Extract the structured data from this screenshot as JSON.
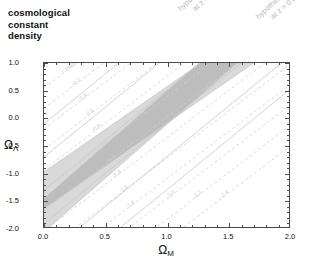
{
  "title": {
    "line1": "cosmological",
    "line2": "constant",
    "line3": "density"
  },
  "axes": {
    "xlabel": "Ω",
    "xlabel_sub": "M",
    "ylabel": "Ω",
    "ylabel_sub": "Λ",
    "xlim": [
      0.0,
      2.0
    ],
    "ylim": [
      -2.0,
      1.0
    ],
    "xticks": [
      "0.0",
      "0.5",
      "1.0",
      "1.5",
      "2.0"
    ],
    "xtick_values": [
      0.0,
      0.5,
      1.0,
      1.5,
      2.0
    ],
    "yticks": [
      "1.0",
      "0.5",
      "0.0",
      "-0.5",
      "-1.0",
      "-1.5",
      "-2.0"
    ],
    "ytick_values": [
      1.0,
      0.5,
      0.0,
      -0.5,
      -1.0,
      -1.5,
      -2.0
    ],
    "minor_per_interval": 5,
    "grid": false
  },
  "annotations": {
    "sn_z10": {
      "line1": "hypothetical SN",
      "line2": "at  z = 1.0"
    },
    "sn_z05": {
      "line1": "hypothetical SN",
      "line2": "at  z = 0.5"
    },
    "mag_label": "mag ="
  },
  "colors": {
    "band_light": "#d9d9d9",
    "band_overlap": "#bdbdbd",
    "contour_dashed": "#cfcfcf",
    "contour_solid": "#c8c8c8",
    "frame": "#4a4a4a",
    "text": "#111111",
    "faint_text": "#b9b9b9"
  },
  "chart_data": {
    "type": "line",
    "title": "cosmological constant density",
    "xlabel": "Ω_M",
    "ylabel": "Ω_Λ",
    "xlim": [
      0.0,
      2.0
    ],
    "ylim": [
      -2.0,
      1.0
    ],
    "grid": false,
    "legend": "none",
    "bands": [
      {
        "name": "hypothetical SN at z = 1.0",
        "slope": 1.55,
        "center_intercept": -1.3,
        "half_width": 0.33,
        "fill": "#d9d9d9",
        "points_lower": [
          [
            0.0,
            -1.95
          ],
          [
            0.5,
            -1.18
          ],
          [
            1.0,
            -0.4
          ],
          [
            1.5,
            0.38
          ],
          [
            2.0,
            1.15
          ]
        ],
        "points_upper": [
          [
            0.0,
            -1.29
          ],
          [
            0.5,
            -0.52
          ],
          [
            1.0,
            0.26
          ],
          [
            1.5,
            1.03
          ],
          [
            2.0,
            1.81
          ]
        ]
      },
      {
        "name": "hypothetical SN at z = 0.5",
        "slope": 1.95,
        "center_intercept": -1.75,
        "half_width": 0.3,
        "fill": "#d9d9d9",
        "points_lower": [
          [
            0.0,
            -2.35
          ],
          [
            0.5,
            -1.38
          ],
          [
            1.0,
            -0.4
          ],
          [
            1.5,
            0.58
          ],
          [
            2.0,
            1.55
          ]
        ],
        "points_upper": [
          [
            0.0,
            -1.75
          ],
          [
            0.5,
            -0.78
          ],
          [
            1.0,
            0.2
          ],
          [
            1.5,
            1.18
          ],
          [
            2.0,
            2.15
          ]
        ]
      }
    ],
    "overlap_fill": "#bdbdbd",
    "contours": {
      "style": "dashed",
      "color": "#cfcfcf",
      "label_prefix": "mag =",
      "labels": [
        "mag =",
        "-0.2",
        "-0.4",
        "-0.6",
        "-0.8",
        "-1.0",
        "-1.2",
        "-1.4",
        "-1.6",
        "-1.8",
        "-2.0",
        "-2.2",
        "-2.4"
      ],
      "slope": 1.7,
      "intercepts": [
        0.55,
        0.18,
        -0.19,
        -0.56,
        -0.93,
        -1.3,
        -1.67,
        -2.04,
        -2.41,
        -2.78,
        -3.15,
        -3.52,
        -3.89
      ]
    },
    "solid_contours": {
      "style": "solid",
      "color": "#c8c8c8",
      "slope": 1.82,
      "intercepts": [
        -0.1,
        -0.7,
        -1.3,
        -1.9,
        -2.5,
        -3.1
      ]
    }
  }
}
